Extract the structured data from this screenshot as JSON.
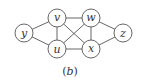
{
  "diagram": {
    "type": "graph",
    "caption": {
      "open": "(",
      "letter": "b",
      "close": ")"
    },
    "nodes": [
      {
        "id": "y",
        "label": "y",
        "x": 24,
        "y": 33
      },
      {
        "id": "v",
        "label": "v",
        "x": 57,
        "y": 18
      },
      {
        "id": "u",
        "label": "u",
        "x": 57,
        "y": 49
      },
      {
        "id": "w",
        "label": "w",
        "x": 91,
        "y": 18
      },
      {
        "id": "x",
        "label": "x",
        "x": 91,
        "y": 49
      },
      {
        "id": "z",
        "label": "z",
        "x": 123,
        "y": 33
      }
    ],
    "edges": [
      [
        "y",
        "v"
      ],
      [
        "y",
        "u"
      ],
      [
        "v",
        "w"
      ],
      [
        "v",
        "u"
      ],
      [
        "v",
        "x"
      ],
      [
        "u",
        "w"
      ],
      [
        "u",
        "x"
      ],
      [
        "w",
        "x"
      ],
      [
        "w",
        "z"
      ],
      [
        "x",
        "z"
      ]
    ],
    "colors": {
      "stroke": "#555555",
      "text": "#333333",
      "fill": "#ffffff"
    }
  }
}
